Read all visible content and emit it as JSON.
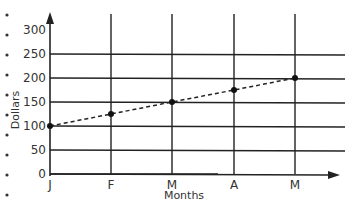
{
  "chart_data": {
    "type": "line",
    "title": "",
    "xlabel": "Months",
    "ylabel": "Dollars",
    "categories": [
      "J",
      "F",
      "M",
      "A",
      "M"
    ],
    "series": [
      {
        "name": "Dollars",
        "values": [
          100,
          125,
          150,
          175,
          200
        ],
        "style": "dashed",
        "markers": true
      }
    ],
    "yticks": [
      "0",
      "50",
      "100",
      "150",
      "200",
      "250",
      "300"
    ],
    "ylim": [
      0,
      300
    ],
    "grid": true
  },
  "bullets_count": 10
}
